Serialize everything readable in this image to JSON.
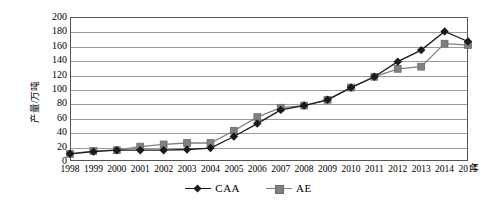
{
  "chart_data": {
    "type": "line",
    "title": "",
    "subtitle": "",
    "xlabel": "年",
    "ylabel": "产量/万吨",
    "x": [
      1998,
      1999,
      2000,
      2001,
      2002,
      2003,
      2004,
      2005,
      2006,
      2007,
      2008,
      2009,
      2010,
      2011,
      2012,
      2013,
      2014,
      2015
    ],
    "categories": [
      "1998",
      "1999",
      "2000",
      "2001",
      "2002",
      "2003",
      "2004",
      "2005",
      "2006",
      "2007",
      "2008",
      "2009",
      "2010",
      "2011",
      "2012",
      "2013",
      "2014",
      "2015"
    ],
    "series": [
      {
        "name": "CAA",
        "color": "#1a1a1a",
        "marker": "diamond",
        "values": [
          10,
          13,
          15,
          15,
          15,
          16,
          18,
          34,
          52,
          71,
          77,
          85,
          102,
          117,
          138,
          154,
          180,
          166
        ]
      },
      {
        "name": "AE",
        "color": "#808080",
        "marker": "square",
        "values": [
          10,
          14,
          15,
          20,
          23,
          25,
          25,
          42,
          61,
          74,
          77,
          85,
          102,
          117,
          128,
          131,
          163,
          161
        ]
      }
    ],
    "ylim": [
      0,
      200
    ],
    "ytick_step": 20,
    "yticks": [
      "200",
      "180",
      "160",
      "140",
      "120",
      "100",
      "80",
      "60",
      "40",
      "20",
      "0"
    ],
    "xlim": [
      1998,
      2015
    ],
    "grid": true,
    "grid_axis": "y",
    "legend_position": "bottom-center"
  },
  "legend": {
    "entries": [
      {
        "label": "CAA"
      },
      {
        "label": "AE"
      }
    ]
  },
  "axis": {
    "y_title": "产量/万吨",
    "x_unit": "年"
  },
  "colors": {
    "series_caa": "#1a1a1a",
    "series_ae": "#808080",
    "gridline": "#9a9a9a",
    "frame": "#555555",
    "background": "#ffffff"
  }
}
